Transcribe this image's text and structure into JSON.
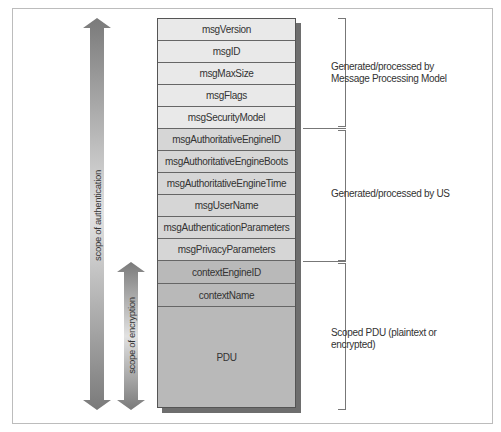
{
  "diagram": {
    "fields": [
      {
        "label": "msgVersion",
        "group": "mpm"
      },
      {
        "label": "msgID",
        "group": "mpm"
      },
      {
        "label": "msgMaxSize",
        "group": "mpm"
      },
      {
        "label": "msgFlags",
        "group": "mpm"
      },
      {
        "label": "msgSecurityModel",
        "group": "mpm"
      },
      {
        "label": "msgAuthoritativeEngineID",
        "group": "us"
      },
      {
        "label": "msgAuthoritativeEngineBoots",
        "group": "us"
      },
      {
        "label": "msgAuthoritativeEngineTime",
        "group": "us"
      },
      {
        "label": "msgUserName",
        "group": "us"
      },
      {
        "label": "msgAuthenticationParameters",
        "group": "us"
      },
      {
        "label": "msgPrivacyParameters",
        "group": "us"
      },
      {
        "label": "contextEngineID",
        "group": "scoped"
      },
      {
        "label": "contextName",
        "group": "scoped"
      },
      {
        "label": "PDU",
        "group": "scoped"
      }
    ],
    "brackets": [
      {
        "label_line1": "Generated/processed by",
        "label_line2": "Message Processing Model"
      },
      {
        "label_line1": "Generated/processed by US",
        "label_line2": ""
      },
      {
        "label_line1": "Scoped PDU (plaintext or",
        "label_line2": "encrypted)"
      }
    ],
    "arrows": [
      {
        "label": "scope of authentication"
      },
      {
        "label": "scope of encryption"
      }
    ],
    "colors": {
      "mpm_fill": "#e9e9e9",
      "us_fill": "#d6d6d6",
      "scoped_fill": "#b9b9b9",
      "shadow": "#6e6e6e",
      "arrow_dark": "#7a7a7a",
      "arrow_light": "#e2e2e2"
    }
  }
}
